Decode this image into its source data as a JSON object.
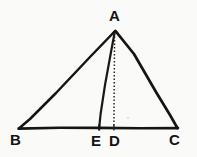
{
  "figure": {
    "background_color": "#fafaf9",
    "ink_color": "#141312",
    "labels": {
      "apex": "A",
      "bottom_left": "B",
      "foot_cevian": "E",
      "foot_altitude": "D",
      "bottom_right": "C"
    },
    "points": {
      "A": {
        "x": 115,
        "y": 30
      },
      "B": {
        "x": 18,
        "y": 128
      },
      "E": {
        "x": 99,
        "y": 128
      },
      "D": {
        "x": 114,
        "y": 128
      },
      "C": {
        "x": 178,
        "y": 128
      }
    },
    "segments": [
      {
        "name": "AB",
        "from": "A",
        "to": "B",
        "style": "solid"
      },
      {
        "name": "AC",
        "from": "A",
        "to": "C",
        "style": "solid"
      },
      {
        "name": "BC",
        "from": "B",
        "to": "C",
        "style": "solid"
      },
      {
        "name": "AE",
        "from": "A",
        "to": "E",
        "style": "solid"
      },
      {
        "name": "AD",
        "from": "A",
        "to": "D",
        "style": "dotted"
      }
    ],
    "label_positions": {
      "A": {
        "left": 109,
        "top": 8
      },
      "B": {
        "left": 10,
        "top": 132
      },
      "E": {
        "left": 91,
        "top": 133
      },
      "D": {
        "left": 109,
        "top": 133
      },
      "C": {
        "left": 169,
        "top": 132
      }
    }
  }
}
